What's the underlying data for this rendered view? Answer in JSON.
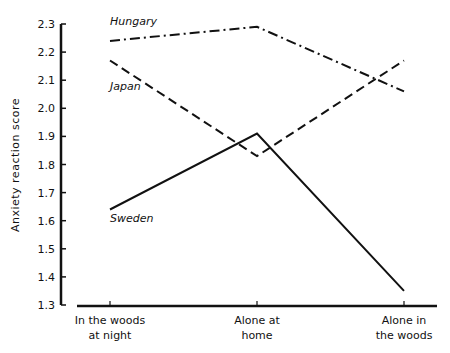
{
  "chart_data": {
    "type": "line",
    "title": "",
    "xlabel": "",
    "ylabel": "Anxiety reaction score",
    "ylim": [
      1.3,
      2.3
    ],
    "yticks": [
      1.3,
      1.4,
      1.5,
      1.6,
      1.7,
      1.8,
      1.9,
      2.0,
      2.1,
      2.2,
      2.3
    ],
    "ytick_labels": [
      "1.3",
      "1.4",
      "1.5",
      "1.6",
      "1.7",
      "1.8",
      "1.9",
      "2.0",
      "2.1",
      "2.2",
      "2.3"
    ],
    "categories": [
      [
        "In the woods",
        "at night"
      ],
      [
        "Alone at",
        "home"
      ],
      [
        "Alone in",
        "the woods"
      ]
    ],
    "grid": false,
    "legend": "inline labels",
    "series": [
      {
        "name": "Hungary",
        "style": "dash-dot",
        "values": [
          2.24,
          2.29,
          2.06
        ],
        "label_pos": [
          110,
          25
        ]
      },
      {
        "name": "Japan",
        "style": "dashed",
        "values": [
          2.17,
          1.83,
          2.17
        ],
        "label_pos": [
          110,
          90
        ]
      },
      {
        "name": "Sweden",
        "style": "solid",
        "values": [
          1.64,
          1.91,
          1.35
        ],
        "label_pos": [
          110,
          222
        ]
      }
    ]
  },
  "colors": {
    "ink": "#111111",
    "background": "#ffffff"
  }
}
